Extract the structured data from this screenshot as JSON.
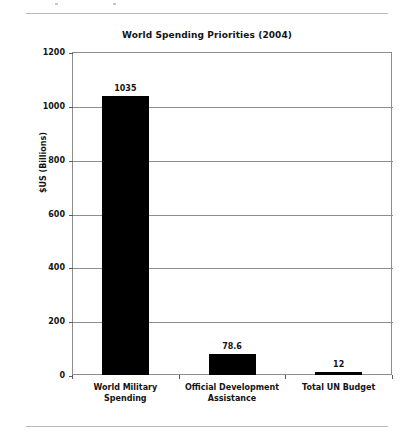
{
  "page": {
    "has_top_rule": true,
    "has_bottom_rule": true,
    "background_color": "#ffffff"
  },
  "chart_data": {
    "type": "bar",
    "title": "World Spending Priorities (2004)",
    "subtitle": "",
    "xlabel": "",
    "ylabel": "$US (Billions)",
    "categories": [
      "World Military Spending",
      "Official Development Assistance",
      "Total UN Budget"
    ],
    "category_lines": [
      [
        "World Military",
        "Spending"
      ],
      [
        "Official Development",
        "Assistance"
      ],
      [
        "Total UN Budget"
      ]
    ],
    "values": [
      1035,
      78.6,
      12
    ],
    "value_labels": [
      "1035",
      "78.6",
      "12"
    ],
    "ylim": [
      0,
      1200
    ],
    "yticks": [
      0,
      200,
      400,
      600,
      800,
      1000,
      1200
    ],
    "ytick_labels": [
      "0",
      "200",
      "400",
      "600",
      "800",
      "1000",
      "1200"
    ],
    "grid": true,
    "grid_axis": "y",
    "legend": false,
    "legend_position": "none",
    "bar_color": "#000000",
    "axis_color": "#8d8d8d",
    "text_color": "#141414"
  }
}
